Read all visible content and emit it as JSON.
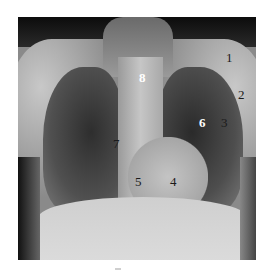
{
  "image": {
    "description": "Posteroanterior chest radiograph with numbered anatomical labels",
    "labels": [
      {
        "text": "1",
        "color": "dark"
      },
      {
        "text": "2",
        "color": "dark"
      },
      {
        "text": "3",
        "color": "dark"
      },
      {
        "text": "4",
        "color": "dark"
      },
      {
        "text": "5",
        "color": "dark"
      },
      {
        "text": "6",
        "color": "light"
      },
      {
        "text": "7",
        "color": "dark"
      },
      {
        "text": "8",
        "color": "light"
      }
    ]
  }
}
